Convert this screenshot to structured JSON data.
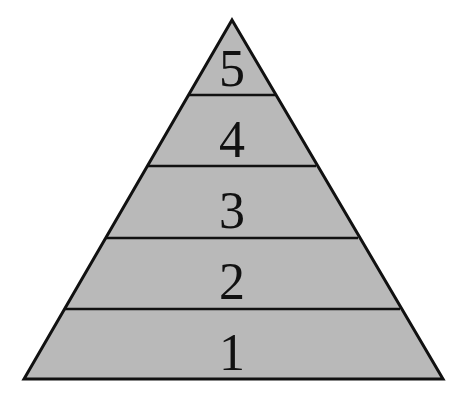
{
  "diagram": {
    "type": "pyramid",
    "fill_color": "#b9b9b9",
    "stroke_color": "#111111",
    "levels": [
      {
        "label": "1"
      },
      {
        "label": "2"
      },
      {
        "label": "3"
      },
      {
        "label": "4"
      },
      {
        "label": "5"
      }
    ]
  }
}
